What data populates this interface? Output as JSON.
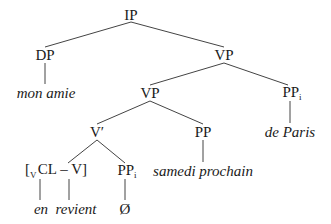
{
  "tree": {
    "nodes": {
      "ip": {
        "label": "IP"
      },
      "dp": {
        "label": "DP"
      },
      "vp_top": {
        "label": "VP"
      },
      "mon_amie": {
        "label": "mon amie"
      },
      "vp_mid": {
        "label": "VP"
      },
      "pp_i_right": {
        "label": "PP",
        "index": "i"
      },
      "v_bar": {
        "label": "V′"
      },
      "pp": {
        "label": "PP"
      },
      "de_paris": {
        "label": "de Paris"
      },
      "cl_v": {
        "open": "[",
        "sub": "V",
        "body": "CL – V]"
      },
      "pp_i_low": {
        "label": "PP",
        "index": "i"
      },
      "samedi_prochain": {
        "label": "samedi prochain"
      },
      "en": {
        "label": "en"
      },
      "revient": {
        "label": "revient"
      },
      "empty": {
        "label": "Ø"
      }
    },
    "edges": [
      [
        "ip",
        "dp"
      ],
      [
        "ip",
        "vp_top"
      ],
      [
        "dp",
        "mon_amie"
      ],
      [
        "vp_top",
        "vp_mid"
      ],
      [
        "vp_top",
        "pp_i_right"
      ],
      [
        "vp_mid",
        "v_bar"
      ],
      [
        "vp_mid",
        "pp"
      ],
      [
        "pp_i_right",
        "de_paris"
      ],
      [
        "v_bar",
        "cl_v"
      ],
      [
        "v_bar",
        "pp_i_low"
      ],
      [
        "pp",
        "samedi_prochain"
      ],
      [
        "cl_v",
        "en"
      ],
      [
        "cl_v",
        "revient"
      ],
      [
        "pp_i_low",
        "empty"
      ]
    ]
  }
}
